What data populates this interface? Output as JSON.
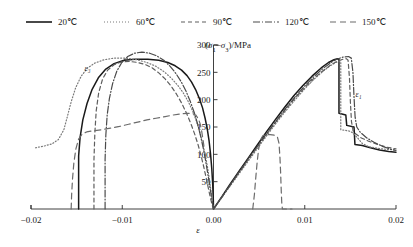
{
  "chart_data": {
    "type": "line",
    "title": "",
    "xlabel": "ε",
    "ylabel": "(σ₁−σ₃)/MPa",
    "xlim": [
      -0.02,
      0.02
    ],
    "ylim": [
      0,
      300
    ],
    "xticks": [
      -0.02,
      -0.01,
      0.0,
      0.01,
      0.02
    ],
    "xticklabels": [
      "−0.02",
      "−0.01",
      "0.00",
      "0.01",
      "0.02"
    ],
    "yticks": [
      50,
      100,
      150,
      200,
      250,
      300
    ],
    "yticklabels": [
      "50",
      "100",
      "150",
      "200",
      "250",
      "300"
    ],
    "grid": false,
    "legend_position": "top",
    "annotations": [
      {
        "text": "ε₃",
        "x": -0.0138,
        "y": 252
      },
      {
        "text": "ε₁",
        "x": 0.0159,
        "y": 205
      }
    ],
    "series": [
      {
        "name": "20℃",
        "color": "#1a1a1a",
        "dash": "none",
        "width": 1.5,
        "branch_radial": [
          [
            -0.01478,
            0.0
          ],
          [
            -0.01478,
            97
          ],
          [
            -0.01462,
            131
          ],
          [
            -0.01432,
            163
          ],
          [
            -0.01386,
            193
          ],
          [
            -0.0133,
            219
          ],
          [
            -0.01262,
            240
          ],
          [
            -0.0118,
            256
          ],
          [
            -0.0109,
            266
          ],
          [
            -0.0098,
            272
          ],
          [
            -0.0086,
            274
          ],
          [
            -0.0072,
            274
          ],
          [
            -0.006,
            272
          ],
          [
            -0.005,
            268
          ],
          [
            -0.0042,
            262
          ],
          [
            -0.0035,
            254
          ],
          [
            -0.0029,
            244
          ],
          [
            -0.0024,
            232
          ],
          [
            -0.00195,
            218
          ],
          [
            -0.00155,
            202
          ],
          [
            -0.0012,
            185
          ],
          [
            -0.00092,
            166
          ],
          [
            -0.00068,
            146
          ],
          [
            -0.00048,
            124
          ],
          [
            -0.00032,
            100
          ],
          [
            -0.00019,
            74
          ],
          [
            -9e-05,
            46
          ],
          [
            -2e-05,
            16
          ],
          [
            0.0,
            0.0
          ]
        ],
        "branch_axial": [
          [
            0.0,
            0.0
          ],
          [
            0.0009,
            22
          ],
          [
            0.0018,
            45
          ],
          [
            0.0028,
            69
          ],
          [
            0.0038,
            93
          ],
          [
            0.0048,
            117
          ],
          [
            0.0058,
            141
          ],
          [
            0.0068,
            164
          ],
          [
            0.0078,
            186
          ],
          [
            0.0088,
            207
          ],
          [
            0.0098,
            226
          ],
          [
            0.0108,
            243
          ],
          [
            0.0118,
            258
          ],
          [
            0.0126,
            268
          ],
          [
            0.0132,
            273
          ],
          [
            0.0136,
            275
          ],
          [
            0.01375,
            274
          ],
          [
            0.01375,
            175
          ],
          [
            0.0145,
            172
          ],
          [
            0.0146,
            153
          ],
          [
            0.0154,
            150
          ],
          [
            0.0155,
            118
          ],
          [
            0.0163,
            116
          ],
          [
            0.0172,
            112
          ],
          [
            0.0182,
            108
          ],
          [
            0.0192,
            105
          ],
          [
            0.02,
            104
          ]
        ]
      },
      {
        "name": "60℃",
        "color": "#7a7a7a",
        "dash": "1,2",
        "width": 1.2,
        "branch_radial": [
          [
            -0.0195,
            112
          ],
          [
            -0.0186,
            115
          ],
          [
            -0.0177,
            119
          ],
          [
            -0.017,
            127
          ],
          [
            -0.0164,
            145
          ],
          [
            -0.016,
            170
          ],
          [
            -0.0156,
            196
          ],
          [
            -0.0151,
            222
          ],
          [
            -0.0145,
            243
          ],
          [
            -0.0138,
            258
          ],
          [
            -0.013,
            267
          ],
          [
            -0.012,
            273
          ],
          [
            -0.0109,
            276
          ],
          [
            -0.0096,
            276
          ],
          [
            -0.0084,
            273
          ],
          [
            -0.0073,
            268
          ],
          [
            -0.0063,
            261
          ],
          [
            -0.0054,
            251
          ],
          [
            -0.0046,
            239
          ],
          [
            -0.0039,
            226
          ],
          [
            -0.0033,
            212
          ],
          [
            -0.00275,
            196
          ],
          [
            -0.00228,
            179
          ],
          [
            -0.00186,
            160
          ],
          [
            -0.0015,
            141
          ],
          [
            -0.00118,
            120
          ],
          [
            -0.0009,
            99
          ],
          [
            -0.00066,
            77
          ],
          [
            -0.00046,
            55
          ],
          [
            -0.00028,
            34
          ],
          [
            -0.00012,
            14
          ],
          [
            0.0,
            0.0
          ]
        ],
        "branch_axial": [
          [
            0.0,
            0.0
          ],
          [
            0.001,
            23
          ],
          [
            0.002,
            46
          ],
          [
            0.003,
            69
          ],
          [
            0.004,
            92
          ],
          [
            0.005,
            115
          ],
          [
            0.006,
            138
          ],
          [
            0.007,
            160
          ],
          [
            0.008,
            181
          ],
          [
            0.009,
            201
          ],
          [
            0.01,
            220
          ],
          [
            0.011,
            237
          ],
          [
            0.012,
            252
          ],
          [
            0.0128,
            262
          ],
          [
            0.0134,
            268
          ],
          [
            0.0139,
            270
          ],
          [
            0.01395,
            269
          ],
          [
            0.01395,
            145
          ],
          [
            0.0148,
            143
          ],
          [
            0.0152,
            140
          ],
          [
            0.0158,
            130
          ],
          [
            0.0163,
            120
          ],
          [
            0.017,
            114
          ],
          [
            0.018,
            111
          ],
          [
            0.019,
            109
          ],
          [
            0.02,
            108
          ]
        ]
      },
      {
        "name": "90℃",
        "color": "#5e5e5e",
        "dash": "4,3",
        "width": 1.2,
        "branch_radial": [
          [
            -0.0131,
            0.0
          ],
          [
            -0.0131,
            90
          ],
          [
            -0.013,
            140
          ],
          [
            -0.01285,
            180
          ],
          [
            -0.01258,
            213
          ],
          [
            -0.01215,
            238
          ],
          [
            -0.0116,
            254
          ],
          [
            -0.0109,
            264
          ],
          [
            -0.0101,
            269
          ],
          [
            -0.0092,
            270
          ],
          [
            -0.0083,
            268
          ],
          [
            -0.00745,
            264
          ],
          [
            -0.0067,
            258
          ],
          [
            -0.006,
            249
          ],
          [
            -0.0053,
            238
          ],
          [
            -0.00465,
            225
          ],
          [
            -0.00405,
            210
          ],
          [
            -0.0035,
            194
          ],
          [
            -0.00298,
            176
          ],
          [
            -0.0025,
            157
          ],
          [
            -0.00206,
            137
          ],
          [
            -0.00168,
            117
          ],
          [
            -0.00134,
            96
          ],
          [
            -0.00104,
            75
          ],
          [
            -0.00078,
            55
          ],
          [
            -0.00054,
            36
          ],
          [
            -0.00032,
            19
          ],
          [
            -0.00014,
            7
          ],
          [
            0.0,
            0.0
          ]
        ],
        "branch_axial": [
          [
            0.0,
            0.0
          ],
          [
            0.001,
            24
          ],
          [
            0.002,
            48
          ],
          [
            0.003,
            72
          ],
          [
            0.004,
            95
          ],
          [
            0.005,
            118
          ],
          [
            0.006,
            141
          ],
          [
            0.007,
            163
          ],
          [
            0.008,
            184
          ],
          [
            0.009,
            204
          ],
          [
            0.01,
            222
          ],
          [
            0.011,
            239
          ],
          [
            0.012,
            253
          ],
          [
            0.0128,
            263
          ],
          [
            0.0135,
            270
          ],
          [
            0.0142,
            274
          ],
          [
            0.01455,
            275
          ],
          [
            0.01475,
            272
          ],
          [
            0.0149,
            240
          ],
          [
            0.015,
            196
          ],
          [
            0.01512,
            160
          ],
          [
            0.0153,
            143
          ],
          [
            0.0156,
            137
          ],
          [
            0.0162,
            130
          ],
          [
            0.017,
            124
          ],
          [
            0.018,
            118
          ],
          [
            0.019,
            113
          ],
          [
            0.02,
            110
          ]
        ]
      },
      {
        "name": "120℃",
        "color": "#4a4a4a",
        "dash": "7,2,1,2",
        "width": 1.2,
        "branch_radial": [
          [
            -0.01188,
            0.0
          ],
          [
            -0.01188,
            90
          ],
          [
            -0.0118,
            135
          ],
          [
            -0.01165,
            172
          ],
          [
            -0.0114,
            203
          ],
          [
            -0.01105,
            230
          ],
          [
            -0.0106,
            252
          ],
          [
            -0.01005,
            268
          ],
          [
            -0.0094,
            279
          ],
          [
            -0.00865,
            285
          ],
          [
            -0.00785,
            287
          ],
          [
            -0.007,
            285
          ],
          [
            -0.0062,
            280
          ],
          [
            -0.00545,
            272
          ],
          [
            -0.00475,
            261
          ],
          [
            -0.00412,
            248
          ],
          [
            -0.00355,
            233
          ],
          [
            -0.00302,
            216
          ],
          [
            -0.00255,
            197
          ],
          [
            -0.00212,
            177
          ],
          [
            -0.00175,
            156
          ],
          [
            -0.00142,
            134
          ],
          [
            -0.00113,
            112
          ],
          [
            -0.00088,
            90
          ],
          [
            -0.00066,
            68
          ],
          [
            -0.00046,
            47
          ],
          [
            -0.00028,
            28
          ],
          [
            -0.00012,
            11
          ],
          [
            0.0,
            0.0
          ]
        ],
        "branch_axial": [
          [
            0.0,
            0.0
          ],
          [
            0.001,
            24
          ],
          [
            0.002,
            48
          ],
          [
            0.003,
            72
          ],
          [
            0.004,
            96
          ],
          [
            0.005,
            119
          ],
          [
            0.006,
            142
          ],
          [
            0.007,
            164
          ],
          [
            0.008,
            186
          ],
          [
            0.009,
            206
          ],
          [
            0.01,
            225
          ],
          [
            0.011,
            242
          ],
          [
            0.012,
            257
          ],
          [
            0.0128,
            267
          ],
          [
            0.0135,
            274
          ],
          [
            0.0142,
            278
          ],
          [
            0.0148,
            279
          ],
          [
            0.0151,
            276
          ],
          [
            0.01528,
            250
          ],
          [
            0.0154,
            205
          ],
          [
            0.01552,
            168
          ],
          [
            0.0157,
            150
          ],
          [
            0.0161,
            140
          ],
          [
            0.0168,
            130
          ],
          [
            0.0176,
            122
          ],
          [
            0.0186,
            114
          ],
          [
            0.0195,
            109
          ],
          [
            0.02,
            107
          ]
        ]
      },
      {
        "name": "150℃",
        "color": "#6b6b6b",
        "dash": "6,4",
        "width": 1.2,
        "branch_radial": [
          [
            -0.0156,
            0.0
          ],
          [
            -0.01555,
            25
          ],
          [
            -0.01545,
            55
          ],
          [
            -0.0153,
            85
          ],
          [
            -0.01508,
            110
          ],
          [
            -0.01478,
            128
          ],
          [
            -0.0144,
            137
          ],
          [
            -0.0139,
            141
          ],
          [
            -0.0132,
            143
          ],
          [
            -0.0123,
            145
          ],
          [
            -0.0113,
            148
          ],
          [
            -0.0103,
            151
          ],
          [
            -0.0093,
            155
          ],
          [
            -0.0083,
            159
          ],
          [
            -0.0073,
            163
          ],
          [
            -0.0063,
            166
          ],
          [
            -0.0053,
            169
          ],
          [
            -0.0044,
            172
          ],
          [
            -0.0036,
            174
          ],
          [
            -0.0029,
            175
          ],
          [
            -0.00235,
            175
          ],
          [
            -0.00195,
            172
          ],
          [
            -0.00165,
            165
          ],
          [
            -0.00145,
            155
          ],
          [
            -0.0013,
            143
          ],
          [
            -0.00118,
            130
          ],
          [
            -0.00105,
            115
          ]
        ],
        "branch_axial": [
          [
            0.0043,
            0.0
          ],
          [
            0.00448,
            26
          ],
          [
            0.00462,
            55
          ],
          [
            0.00478,
            85
          ],
          [
            0.00495,
            110
          ],
          [
            0.00515,
            126
          ],
          [
            0.0054,
            134
          ],
          [
            0.00575,
            136
          ],
          [
            0.0062,
            136
          ],
          [
            0.00665,
            135
          ],
          [
            0.007,
            132
          ],
          [
            0.00718,
            120
          ],
          [
            0.00728,
            95
          ],
          [
            0.00736,
            65
          ],
          [
            0.00742,
            35
          ],
          [
            0.00748,
            12
          ],
          [
            0.00755,
            0.0
          ],
          [
            0.0086,
            0.0
          ]
        ]
      }
    ]
  },
  "legend": {
    "items": [
      {
        "label": "20℃",
        "dash": "none",
        "color": "#1a1a1a"
      },
      {
        "label": "60℃",
        "dash": "1,2",
        "color": "#7a7a7a"
      },
      {
        "label": "90℃",
        "dash": "4,3",
        "color": "#5e5e5e"
      },
      {
        "label": "120℃",
        "dash": "7,2,1,2",
        "color": "#4a4a4a"
      },
      {
        "label": "150℃",
        "dash": "6,4",
        "color": "#6b6b6b"
      }
    ]
  }
}
